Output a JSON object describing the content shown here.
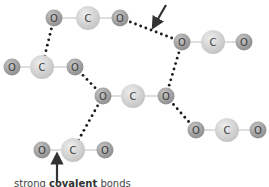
{
  "labels": {
    "top": {
      "text": "between molecules"
    },
    "bottom": {
      "prefix": "strong ",
      "bold": "covalent",
      "suffix": " bonds"
    }
  },
  "atom_symbols": {
    "oxygen": "O",
    "carbon": "C"
  },
  "molecules": [
    {
      "name": "CO2",
      "atoms": [
        {
          "el": "O",
          "x": 54,
          "y": 18
        },
        {
          "el": "C",
          "x": 88,
          "y": 18
        },
        {
          "el": "O",
          "x": 120,
          "y": 18
        }
      ]
    },
    {
      "name": "CO2",
      "atoms": [
        {
          "el": "O",
          "x": 182,
          "y": 42
        },
        {
          "el": "C",
          "x": 213,
          "y": 42
        },
        {
          "el": "O",
          "x": 244,
          "y": 42
        }
      ]
    },
    {
      "name": "CO2",
      "atoms": [
        {
          "el": "O",
          "x": 12,
          "y": 67
        },
        {
          "el": "C",
          "x": 42,
          "y": 67
        },
        {
          "el": "O",
          "x": 75,
          "y": 67
        }
      ]
    },
    {
      "name": "CO2",
      "atoms": [
        {
          "el": "O",
          "x": 103,
          "y": 96
        },
        {
          "el": "C",
          "x": 133,
          "y": 96
        },
        {
          "el": "O",
          "x": 166,
          "y": 96
        }
      ]
    },
    {
      "name": "CO2",
      "atoms": [
        {
          "el": "O",
          "x": 196,
          "y": 130
        },
        {
          "el": "C",
          "x": 227,
          "y": 130
        },
        {
          "el": "O",
          "x": 258,
          "y": 130
        }
      ]
    },
    {
      "name": "CO2",
      "atoms": [
        {
          "el": "O",
          "x": 42,
          "y": 150
        },
        {
          "el": "C",
          "x": 73,
          "y": 150
        },
        {
          "el": "O",
          "x": 105,
          "y": 150
        }
      ]
    }
  ],
  "intermolecular_bonds": [
    {
      "from": [
        120,
        18
      ],
      "to": [
        182,
        42
      ]
    },
    {
      "from": [
        54,
        18
      ],
      "to": [
        42,
        67
      ]
    },
    {
      "from": [
        182,
        42
      ],
      "to": [
        166,
        96
      ]
    },
    {
      "from": [
        75,
        67
      ],
      "to": [
        103,
        96
      ]
    },
    {
      "from": [
        166,
        96
      ],
      "to": [
        196,
        130
      ]
    },
    {
      "from": [
        103,
        96
      ],
      "to": [
        73,
        150
      ]
    }
  ],
  "arrows": [
    {
      "name": "top-arrow",
      "from": [
        166,
        5
      ],
      "to": [
        155,
        24
      ]
    },
    {
      "name": "bottom-arrow",
      "from": [
        57,
        182
      ],
      "to": [
        57,
        158
      ]
    }
  ],
  "colors": {
    "oxygen": "#9a9a9a",
    "oxygen_highlight": "#c8c8c8",
    "carbon": "#cfcfcf",
    "carbon_highlight": "#ececec",
    "bond": "#bdbdbd",
    "dots": "#1a1a1a",
    "arrow": "#333333"
  }
}
